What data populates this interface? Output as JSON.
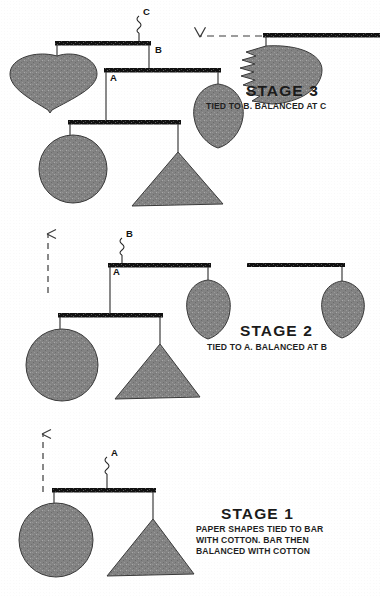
{
  "figure": {
    "title_absent": true,
    "background_color": "#ffffff",
    "ink_color": "#1b1b1b",
    "shape_fill": "#7e7e7e",
    "shape_stroke": "#2a2a2a",
    "bar_color": "#121212"
  },
  "stages": [
    {
      "id": "stage-3",
      "title": "STAGE 3",
      "caption": "TIED TO B. BALANCED AT C",
      "title_pos": {
        "x": 246,
        "y": 82
      },
      "caption_pos": {
        "x": 206,
        "y": 101
      },
      "tie_label": "C",
      "balance_point": "C",
      "tied_to": "B"
    },
    {
      "id": "stage-2",
      "title": "STAGE 2",
      "caption": "TIED TO A. BALANCED AT B",
      "title_pos": {
        "x": 240,
        "y": 322
      },
      "caption_pos": {
        "x": 207,
        "y": 342
      },
      "tie_label": "B",
      "balance_point": "B",
      "tied_to": "A"
    },
    {
      "id": "stage-1",
      "title": "STAGE 1",
      "caption": "PAPER SHAPES TIED TO BAR\nWITH COTTON. BAR THEN\nBALANCED WITH COTTON",
      "title_pos": {
        "x": 221,
        "y": 505
      },
      "caption_pos": {
        "x": 196,
        "y": 524
      },
      "tie_label": "A",
      "balance_point": "A",
      "tied_to": ""
    }
  ],
  "knot_labels": [
    {
      "name": "knot-label-c",
      "text": "C",
      "x": 143,
      "y": 6
    },
    {
      "name": "knot-label-b-stage3",
      "text": "B",
      "x": 155,
      "y": 44
    },
    {
      "name": "knot-label-a-stage3",
      "text": "A",
      "x": 110,
      "y": 72
    },
    {
      "name": "knot-label-b-stage2",
      "text": "B",
      "x": 126,
      "y": 228
    },
    {
      "name": "knot-label-a-stage2",
      "text": "A",
      "x": 113,
      "y": 266
    },
    {
      "name": "knot-label-a-stage1",
      "text": "A",
      "x": 111,
      "y": 447
    }
  ],
  "shapes": {
    "stage3": [
      {
        "name": "heart-shape",
        "type": "heart"
      },
      {
        "name": "leaf-shape",
        "type": "leaf"
      },
      {
        "name": "circle-shape",
        "type": "circle"
      },
      {
        "name": "triangle-shape",
        "type": "triangle"
      },
      {
        "name": "ragged-fan-shape",
        "type": "ragged-fan"
      }
    ],
    "stage2": [
      {
        "name": "circle-shape",
        "type": "circle"
      },
      {
        "name": "triangle-shape",
        "type": "triangle"
      },
      {
        "name": "leaf-shape-left",
        "type": "leaf"
      },
      {
        "name": "leaf-shape-right",
        "type": "leaf"
      }
    ],
    "stage1": [
      {
        "name": "circle-shape",
        "type": "circle"
      },
      {
        "name": "triangle-shape",
        "type": "triangle"
      }
    ]
  },
  "arrows": [
    {
      "name": "assembly-arrow-stage1-to-stage2",
      "direction": "up",
      "style": "dashed",
      "x": 43,
      "y_from": 492,
      "y_to": 432
    },
    {
      "name": "assembly-arrow-stage2-to-stage3",
      "direction": "up",
      "style": "dashed",
      "x": 48,
      "y_from": 293,
      "y_to": 232
    },
    {
      "name": "assembly-arrow-stage3-attach",
      "direction": "left",
      "style": "dashed",
      "x_from": 262,
      "x_to": 198,
      "y": 36
    }
  ]
}
